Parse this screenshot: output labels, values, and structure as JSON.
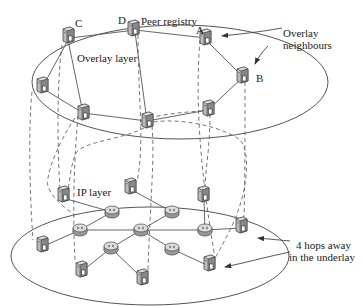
{
  "diagram": {
    "labels": {
      "overlay_layer": "Overlay layer",
      "ip_layer": "IP layer",
      "peer_registry": "Peer registry",
      "node_c": "C",
      "node_d": "D",
      "node_a": "A",
      "node_b": "B",
      "overlay_neighbours_1": "Overlay",
      "overlay_neighbours_2": "neighbours",
      "hops_1": "4 hops away",
      "hops_2": "in the underlay"
    },
    "overlay_nodes": [
      {
        "id": "C",
        "x": 68,
        "y": 36
      },
      {
        "id": "D",
        "x": 133,
        "y": 29
      },
      {
        "id": "A",
        "x": 205,
        "y": 38
      },
      {
        "id": "B",
        "x": 242,
        "y": 76
      },
      {
        "id": "n1",
        "x": 42,
        "y": 86
      },
      {
        "id": "n2",
        "x": 83,
        "y": 113
      },
      {
        "id": "n3",
        "x": 147,
        "y": 121
      },
      {
        "id": "n4",
        "x": 208,
        "y": 109
      }
    ],
    "overlay_edges": [
      [
        "C",
        "D"
      ],
      [
        "D",
        "A"
      ],
      [
        "A",
        "B"
      ],
      [
        "B",
        "n4"
      ],
      [
        "n4",
        "n3"
      ],
      [
        "n3",
        "n2"
      ],
      [
        "n2",
        "n1"
      ],
      [
        "n1",
        "C"
      ],
      [
        "C",
        "n2"
      ],
      [
        "D",
        "n3"
      ]
    ],
    "ip_servers": [
      {
        "id": "s1",
        "x": 63,
        "y": 195
      },
      {
        "id": "s2",
        "x": 130,
        "y": 187
      },
      {
        "id": "s3",
        "x": 203,
        "y": 195
      },
      {
        "id": "s4",
        "x": 241,
        "y": 226
      },
      {
        "id": "s5",
        "x": 42,
        "y": 245
      },
      {
        "id": "s6",
        "x": 81,
        "y": 270
      },
      {
        "id": "s7",
        "x": 142,
        "y": 278
      },
      {
        "id": "s8",
        "x": 209,
        "y": 264
      }
    ],
    "ip_routers": [
      {
        "id": "r1",
        "x": 112,
        "y": 212
      },
      {
        "id": "r2",
        "x": 80,
        "y": 230
      },
      {
        "id": "r3",
        "x": 141,
        "y": 230
      },
      {
        "id": "r4",
        "x": 111,
        "y": 248
      },
      {
        "id": "r5",
        "x": 172,
        "y": 212
      },
      {
        "id": "r6",
        "x": 172,
        "y": 230
      },
      {
        "id": "r7",
        "x": 172,
        "y": 249
      }
    ],
    "ip_edges": [
      [
        "s1",
        "r1"
      ],
      [
        "r1",
        "r2"
      ],
      [
        "r2",
        "s5"
      ],
      [
        "r2",
        "r3"
      ],
      [
        "r3",
        "r5"
      ],
      [
        "r3",
        "r4"
      ],
      [
        "r4",
        "s6"
      ],
      [
        "r4",
        "s7"
      ],
      [
        "r5",
        "s2"
      ],
      [
        "r3",
        "r7"
      ],
      [
        "r7",
        "s8"
      ],
      [
        "r5",
        "r6"
      ],
      [
        "r6",
        "s3"
      ],
      [
        "r6",
        "s4"
      ]
    ]
  }
}
